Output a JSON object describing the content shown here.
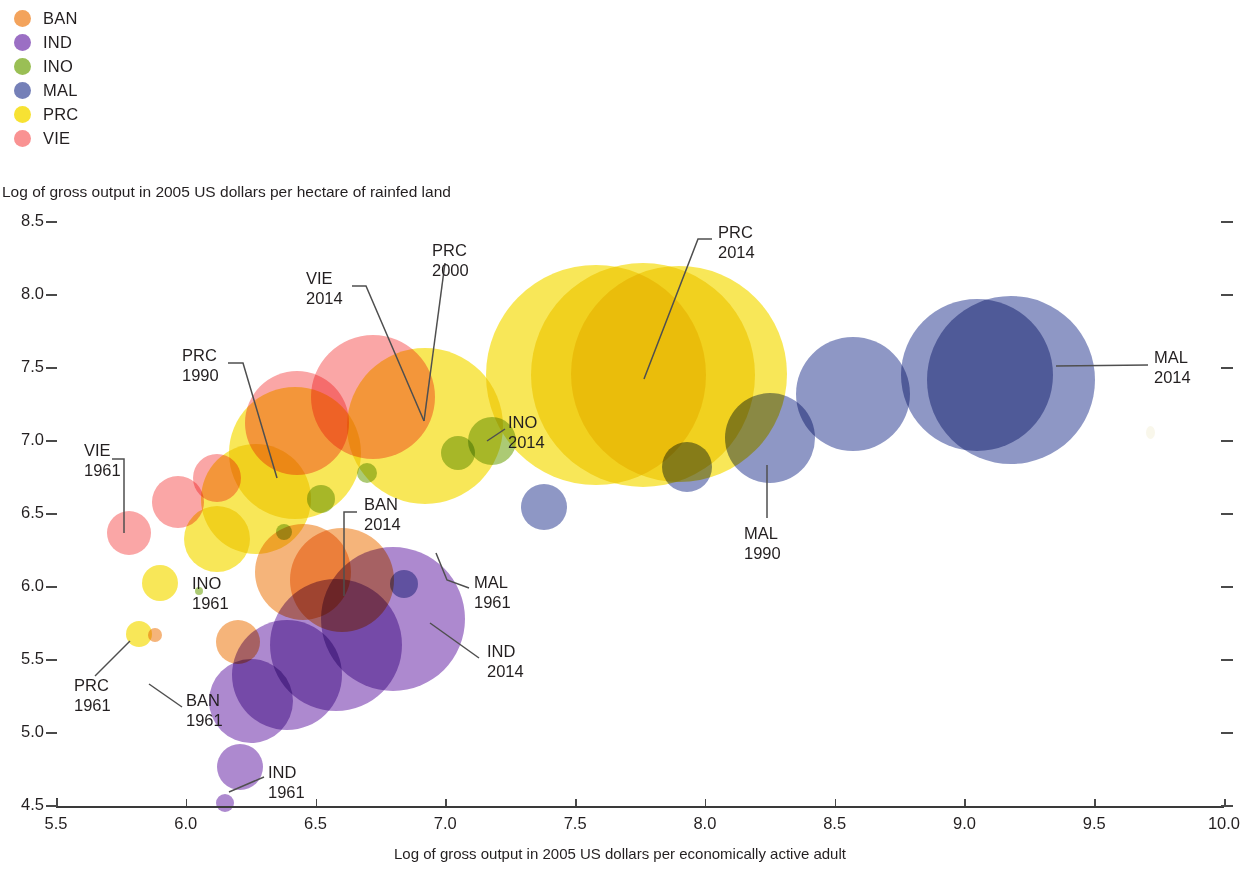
{
  "legend": {
    "items": [
      {
        "label": "BAN",
        "color": "#F3A35C"
      },
      {
        "label": "IND",
        "color": "#9B6FC4"
      },
      {
        "label": "INO",
        "color": "#9ABF55"
      },
      {
        "label": "MAL",
        "color": "#7580B8"
      },
      {
        "label": "PRC",
        "color": "#F7E233"
      },
      {
        "label": "VIE",
        "color": "#F99292"
      }
    ]
  },
  "chart_data": {
    "type": "scatter",
    "title": "",
    "xlabel": "Log of gross output in 2005 US dollars per economically active adult",
    "ylabel": "Log of gross output in 2005 US dollars per hectare of rainfed land",
    "xlim": [
      5.5,
      10.0
    ],
    "ylim": [
      4.5,
      8.5
    ],
    "xticks": [
      "5.5",
      "6.0",
      "6.5",
      "7.0",
      "7.5",
      "8.0",
      "8.5",
      "9.0",
      "9.5",
      "10.0"
    ],
    "yticks": [
      "4.5",
      "5.0",
      "5.5",
      "6.0",
      "6.5",
      "7.0",
      "7.5",
      "8.0",
      "8.5"
    ],
    "grid": false,
    "legend_position": "top-left",
    "bubble_encoding": "bubble area represents total agricultural output",
    "series": [
      {
        "name": "BAN",
        "color": "#F3A35C",
        "points": [
          {
            "x": 5.88,
            "y": 5.67,
            "r": 7,
            "year": 1961
          },
          {
            "x": 6.2,
            "y": 5.62,
            "r": 22,
            "year": 1975
          },
          {
            "x": 6.45,
            "y": 6.1,
            "r": 48,
            "year": 1990
          },
          {
            "x": 6.6,
            "y": 6.05,
            "r": 52,
            "year": 2014
          }
        ]
      },
      {
        "name": "IND",
        "color": "#9B6FC4",
        "points": [
          {
            "x": 6.15,
            "y": 4.52,
            "r": 9,
            "year": 1961
          },
          {
            "x": 6.21,
            "y": 4.77,
            "r": 23,
            "year": 1970
          },
          {
            "x": 6.25,
            "y": 5.22,
            "r": 42,
            "year": 1980
          },
          {
            "x": 6.39,
            "y": 5.4,
            "r": 55,
            "year": 1990
          },
          {
            "x": 6.58,
            "y": 5.6,
            "r": 66,
            "year": 2000
          },
          {
            "x": 6.8,
            "y": 5.78,
            "r": 72,
            "year": 2014
          }
        ]
      },
      {
        "name": "INO",
        "color": "#9ABF55",
        "points": [
          {
            "x": 6.05,
            "y": 5.97,
            "r": 4,
            "year": 1961
          },
          {
            "x": 6.38,
            "y": 6.38,
            "r": 8,
            "year": 1975
          },
          {
            "x": 6.52,
            "y": 6.6,
            "r": 14,
            "year": 1990
          },
          {
            "x": 6.7,
            "y": 6.78,
            "r": 10,
            "year": 2000
          },
          {
            "x": 7.05,
            "y": 6.92,
            "r": 17,
            "year": 2010
          },
          {
            "x": 7.18,
            "y": 7.0,
            "r": 24,
            "year": 2014
          }
        ]
      },
      {
        "name": "MAL",
        "color": "#7580B8",
        "points": [
          {
            "x": 6.84,
            "y": 6.02,
            "r": 14,
            "year": 1961
          },
          {
            "x": 7.38,
            "y": 6.55,
            "r": 23,
            "year": 1975
          },
          {
            "x": 7.93,
            "y": 6.82,
            "r": 25,
            "year": 1980
          },
          {
            "x": 8.25,
            "y": 7.02,
            "r": 45,
            "year": 1990
          },
          {
            "x": 8.57,
            "y": 7.32,
            "r": 57,
            "year": 2000
          },
          {
            "x": 9.05,
            "y": 7.45,
            "r": 76,
            "year": 2010
          },
          {
            "x": 9.18,
            "y": 7.42,
            "r": 84,
            "year": 2014
          }
        ]
      },
      {
        "name": "PRC",
        "color": "#F7E233",
        "points": [
          {
            "x": 5.82,
            "y": 5.68,
            "r": 13,
            "year": 1961
          },
          {
            "x": 5.9,
            "y": 6.03,
            "r": 18,
            "year": 1970
          },
          {
            "x": 6.12,
            "y": 6.33,
            "r": 33,
            "year": 1980
          },
          {
            "x": 6.27,
            "y": 6.6,
            "r": 55,
            "year": 1985
          },
          {
            "x": 6.42,
            "y": 6.92,
            "r": 66,
            "year": 1990
          },
          {
            "x": 6.92,
            "y": 7.1,
            "r": 78,
            "year": 2000
          },
          {
            "x": 7.58,
            "y": 7.45,
            "r": 110,
            "year": 2005
          },
          {
            "x": 7.76,
            "y": 7.45,
            "r": 112,
            "year": 2010
          },
          {
            "x": 7.9,
            "y": 7.46,
            "r": 108,
            "year": 2014
          }
        ]
      },
      {
        "name": "VIE",
        "color": "#F99292",
        "points": [
          {
            "x": 5.78,
            "y": 6.37,
            "r": 22,
            "year": 1961
          },
          {
            "x": 5.97,
            "y": 6.58,
            "r": 26,
            "year": 1975
          },
          {
            "x": 6.12,
            "y": 6.75,
            "r": 24,
            "year": 1985
          },
          {
            "x": 6.43,
            "y": 7.12,
            "r": 52,
            "year": 1995
          },
          {
            "x": 6.72,
            "y": 7.3,
            "r": 62,
            "year": 2014
          }
        ]
      }
    ],
    "annotations": [
      {
        "line1": "VIE",
        "line2": "1961"
      },
      {
        "line1": "PRC",
        "line2": "1961"
      },
      {
        "line1": "BAN",
        "line2": "1961"
      },
      {
        "line1": "INO",
        "line2": "1961"
      },
      {
        "line1": "IND",
        "line2": "1961"
      },
      {
        "line1": "MAL",
        "line2": "1961"
      },
      {
        "line1": "PRC",
        "line2": "1990"
      },
      {
        "line1": "MAL",
        "line2": "1990"
      },
      {
        "line1": "PRC",
        "line2": "2000"
      },
      {
        "line1": "VIE",
        "line2": "2014"
      },
      {
        "line1": "PRC",
        "line2": "2014"
      },
      {
        "line1": "BAN",
        "line2": "2014"
      },
      {
        "line1": "INO",
        "line2": "2014"
      },
      {
        "line1": "IND",
        "line2": "2014"
      },
      {
        "line1": "MAL",
        "line2": "2014"
      }
    ]
  }
}
